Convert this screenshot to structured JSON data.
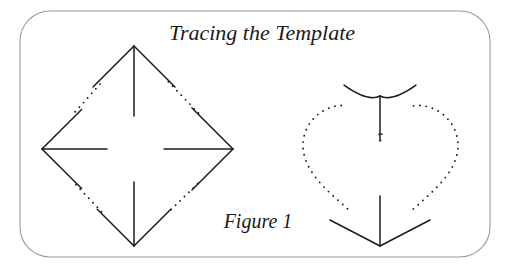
{
  "figure": {
    "title": "Tracing the Template",
    "caption": "Figure 1",
    "frame": {
      "name": "rounded-rectangle-border",
      "x": 20,
      "y": 11,
      "width": 470,
      "height": 246,
      "radius": 30,
      "stroke_color": "#9a9a9a",
      "stroke_width": 1.1,
      "fill_color": "#ffffff"
    },
    "ink_color": "#1c1c1c",
    "background_color": "#ffffff",
    "title_position": {
      "x": 262,
      "y": 40
    },
    "caption_position": {
      "x": 258,
      "y": 228
    }
  },
  "shapes": [
    {
      "name": "diamond-template",
      "label": "diamond",
      "outline_style": "dotted",
      "center": {
        "x": 137,
        "y": 147
      },
      "vertices": {
        "top": {
          "x": 134,
          "y": 46
        },
        "right": {
          "x": 233,
          "y": 149
        },
        "bottom": {
          "x": 134,
          "y": 246
        },
        "left": {
          "x": 42,
          "y": 149
        }
      },
      "dot_radius": 0.95,
      "dot_spacing": 6.2,
      "arrows": [
        {
          "name": "arrow-up",
          "direction": "up",
          "tip": {
            "x": 134,
            "y": 46
          },
          "tail": {
            "x": 134,
            "y": 116
          },
          "barb_length": 58,
          "barb_style": "straight"
        },
        {
          "name": "arrow-right",
          "direction": "right",
          "tip": {
            "x": 233,
            "y": 149
          },
          "tail": {
            "x": 164,
            "y": 149
          },
          "barb_length": 58,
          "barb_style": "straight"
        },
        {
          "name": "arrow-down",
          "direction": "down",
          "tip": {
            "x": 134,
            "y": 246
          },
          "tail": {
            "x": 134,
            "y": 182
          },
          "barb_length": 52,
          "barb_style": "straight"
        },
        {
          "name": "arrow-left",
          "direction": "left",
          "tip": {
            "x": 42,
            "y": 149
          },
          "tail": {
            "x": 107,
            "y": 149
          },
          "barb_length": 56,
          "barb_style": "straight"
        }
      ]
    },
    {
      "name": "heart-template",
      "label": "heart",
      "outline_style": "dotted",
      "center": {
        "x": 380,
        "y": 162
      },
      "bounds": {
        "left": 303,
        "right": 458,
        "top": 85,
        "bottom": 246
      },
      "cleft": {
        "x": 380,
        "y": 96
      },
      "point": {
        "x": 380,
        "y": 246
      },
      "dot_radius": 0.95,
      "dot_spacing": 6.4,
      "arrows": [
        {
          "name": "arrow-cleft-up",
          "direction": "up",
          "tip": {
            "x": 380,
            "y": 96
          },
          "tail": {
            "x": 380,
            "y": 141
          },
          "barb_length": 36,
          "barb_style": "curved"
        },
        {
          "name": "arrow-point-down",
          "direction": "down",
          "tip": {
            "x": 380,
            "y": 246
          },
          "tail": {
            "x": 380,
            "y": 196
          },
          "barb_length": 50,
          "barb_style": "straight"
        }
      ]
    }
  ]
}
